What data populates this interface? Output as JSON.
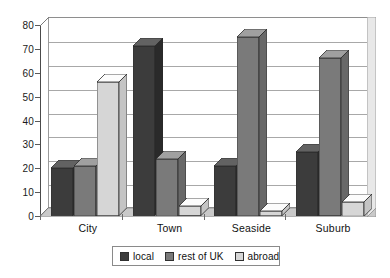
{
  "chart_data": {
    "type": "bar",
    "title": "",
    "subtitle": "",
    "xlabel": "",
    "ylabel": "",
    "categories": [
      "City",
      "Town",
      "Seaside",
      "Suburb"
    ],
    "series": [
      {
        "name": "local",
        "values": [
          20,
          71,
          21,
          27
        ],
        "color": "#3c3c3c"
      },
      {
        "name": "rest of UK",
        "values": [
          21,
          24,
          75,
          66
        ],
        "color": "#7a7a7a"
      },
      {
        "name": "abroad",
        "values": [
          56,
          4,
          2,
          6
        ],
        "color": "#d6d6d6"
      }
    ],
    "ylim": [
      0,
      80
    ],
    "yticks": [
      0,
      10,
      20,
      30,
      40,
      50,
      60,
      70,
      80
    ],
    "ytick_labels": [
      "0",
      "10",
      "20",
      "30",
      "40",
      "50",
      "60",
      "70",
      "80"
    ],
    "grid": true,
    "grid_axis": "y",
    "legend_position": "bottom",
    "style": "3d-clustered-column"
  },
  "legend": {
    "items": [
      {
        "label": "local",
        "color": "#3c3c3c"
      },
      {
        "label": "rest of UK",
        "color": "#7a7a7a"
      },
      {
        "label": "abroad",
        "color": "#d6d6d6"
      }
    ]
  },
  "axes": {
    "y": {
      "labels": [
        "80",
        "70",
        "60",
        "50",
        "40",
        "30",
        "20",
        "10",
        "0"
      ]
    },
    "x": {
      "labels": [
        "City",
        "Town",
        "Seaside",
        "Suburb"
      ]
    }
  },
  "colors": {
    "series_local": "#3c3c3c",
    "series_rest_of_uk": "#7a7a7a",
    "series_abroad": "#d6d6d6",
    "plot_border": "#8e8e8e",
    "gridline": "#a8a8a8",
    "text": "#111111"
  }
}
